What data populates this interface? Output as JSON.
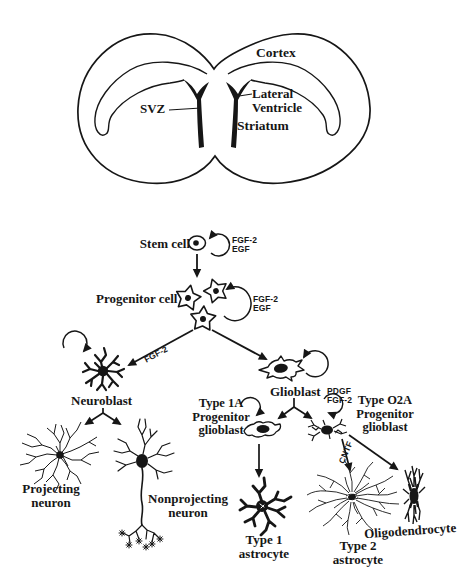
{
  "colors": {
    "ink": "#161616",
    "background": "#ffffff"
  },
  "brain": {
    "cortex": "Cortex",
    "svz": "SVZ",
    "lateral_ventricle": {
      "l1": "Lateral",
      "l2": "Ventricle"
    },
    "striatum": "Striatum"
  },
  "lineage": {
    "stem_cell": "Stem cell",
    "progenitor_cell": "Progenitor cell",
    "neuroblast": "Neuroblast",
    "glioblast": "Glioblast",
    "type_1a": {
      "l1": "Type 1A",
      "l2": "Progenitor",
      "l3": "glioblast"
    },
    "type_o2a": {
      "l1": "Type O2A",
      "l2": "Progenitor",
      "l3": "glioblast"
    },
    "projecting_neuron": {
      "l1": "Projecting",
      "l2": "neuron"
    },
    "nonprojecting_neuron": {
      "l1": "Nonprojecting",
      "l2": "neuron"
    },
    "type_1_astrocyte": {
      "l1": "Type 1",
      "l2": "astrocyte"
    },
    "type_2_astrocyte": {
      "l1": "Type 2",
      "l2": "astrocyte"
    },
    "oligodendrocyte": "Oligodendrocyte"
  },
  "factors": {
    "stem_loop": {
      "l1": "FGF-2",
      "l2": "EGF"
    },
    "progenitor_loop": {
      "l1": "FGF-2",
      "l2": "EGF"
    },
    "neuroblast_arrow": "FGF-2",
    "o2a_loop": {
      "l1": "PDGF",
      "l2": "FGF-2"
    },
    "cntf": "CNTF"
  }
}
